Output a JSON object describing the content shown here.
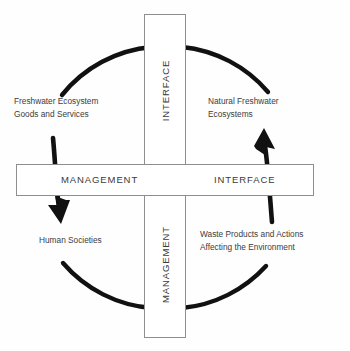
{
  "diagram": {
    "stroke_color": "#111111",
    "bar_fill": "#ffffff",
    "bar_border": "#8e8e8e",
    "text_color": "#3c3c3c",
    "vertical_bar": {
      "upper_label": "INTERFACE",
      "lower_label": "MANAGEMENT"
    },
    "horizontal_bar": {
      "left_label": "MANAGEMENT",
      "right_label": "INTERFACE"
    },
    "nodes": [
      {
        "id": "freshwater-goods",
        "quadrant": "top-left",
        "line1": "Freshwater Ecosystem",
        "line2": "Goods and Services"
      },
      {
        "id": "natural-ecosystems",
        "quadrant": "top-right",
        "line1": "Natural Freshwater",
        "line2": "Ecosystems"
      },
      {
        "id": "human-societies",
        "quadrant": "bottom-left",
        "line1": "Human Societies",
        "line2": ""
      },
      {
        "id": "waste-products",
        "quadrant": "bottom-right",
        "line1": "Waste Products and Actions",
        "line2": "Affecting the Environment"
      }
    ],
    "arrows": [
      {
        "id": "arrow-down-left",
        "direction": "down",
        "points_to": "human-societies"
      },
      {
        "id": "arrow-up-right",
        "direction": "up",
        "points_to": "natural-ecosystems"
      }
    ],
    "cycle": {
      "center_x": 165,
      "center_y": 177,
      "radius": 130,
      "direction": "clockwise"
    }
  }
}
